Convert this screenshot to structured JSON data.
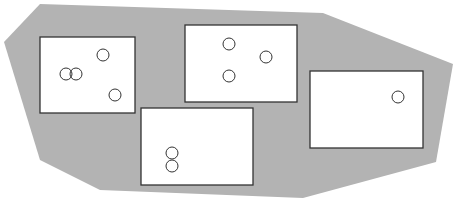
{
  "diagram": {
    "background": "#ffffff",
    "region": {
      "fill": "#b3b3b3",
      "points": [
        [
          40,
          4
        ],
        [
          323,
          13
        ],
        [
          453,
          64
        ],
        [
          436,
          162
        ],
        [
          303,
          198
        ],
        [
          100,
          190
        ],
        [
          40,
          160
        ],
        [
          4,
          42
        ]
      ]
    },
    "boxes": [
      {
        "id": "box-1",
        "x": 40,
        "y": 37,
        "w": 95,
        "h": 76,
        "circles": [
          [
            66,
            74
          ],
          [
            76,
            74
          ],
          [
            103,
            55
          ],
          [
            115,
            95
          ]
        ]
      },
      {
        "id": "box-2",
        "x": 185,
        "y": 25,
        "w": 112,
        "h": 77,
        "circles": [
          [
            229,
            44
          ],
          [
            266,
            57
          ],
          [
            229,
            76
          ]
        ]
      },
      {
        "id": "box-3",
        "x": 141,
        "y": 108,
        "w": 112,
        "h": 77,
        "circles": [
          [
            172,
            153
          ],
          [
            172,
            166
          ]
        ]
      },
      {
        "id": "box-4",
        "x": 310,
        "y": 71,
        "w": 113,
        "h": 77,
        "circles": [
          [
            398,
            97
          ]
        ]
      }
    ],
    "box_fill": "#ffffff",
    "stroke": "#333333",
    "circle_radius": 6
  }
}
